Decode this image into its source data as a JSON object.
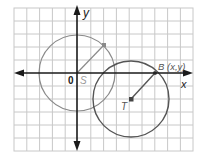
{
  "diagram": {
    "type": "coordinate-plane-circles",
    "grid": {
      "columns": 14,
      "rows": 11,
      "origin_col": 5,
      "origin_row": 5,
      "line_color": "#c8c8c8"
    },
    "axes": {
      "x_label": "x",
      "y_label": "y",
      "origin_label": "0",
      "color": "#1a1a1a"
    },
    "circles": [
      {
        "name": "S",
        "label": "S",
        "center": [
          0,
          0
        ],
        "radius": 3,
        "color": "#8a8a8a",
        "radius_point": [
          2.1,
          2.2
        ]
      },
      {
        "name": "T",
        "label": "T",
        "center": [
          4.2,
          -2
        ],
        "radius": 3,
        "color": "#555555",
        "radius_point": [
          6.1,
          0
        ]
      }
    ],
    "points": [
      {
        "name": "B",
        "label": "B (x,y)"
      },
      {
        "name": "T",
        "label": "T"
      },
      {
        "name": "S",
        "label": "S"
      }
    ]
  }
}
